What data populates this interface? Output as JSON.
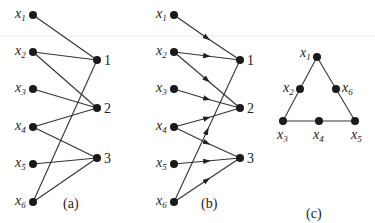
{
  "panels": [
    {
      "id": "a",
      "caption": "(a)",
      "left_nodes": [
        {
          "var": "x",
          "sub": "1"
        },
        {
          "var": "x",
          "sub": "2"
        },
        {
          "var": "x",
          "sub": "3"
        },
        {
          "var": "x",
          "sub": "4"
        },
        {
          "var": "x",
          "sub": "5"
        },
        {
          "var": "x",
          "sub": "6"
        }
      ],
      "right_nodes": [
        "1",
        "2",
        "3"
      ],
      "edges": [
        [
          "x1",
          "1"
        ],
        [
          "x2",
          "1"
        ],
        [
          "x2",
          "2"
        ],
        [
          "x3",
          "2"
        ],
        [
          "x4",
          "2"
        ],
        [
          "x4",
          "3"
        ],
        [
          "x5",
          "3"
        ],
        [
          "x6",
          "3"
        ],
        [
          "x6",
          "1"
        ]
      ],
      "directed": false
    },
    {
      "id": "b",
      "caption": "(b)",
      "left_nodes": [
        {
          "var": "x",
          "sub": "1"
        },
        {
          "var": "x",
          "sub": "2"
        },
        {
          "var": "x",
          "sub": "3"
        },
        {
          "var": "x",
          "sub": "4"
        },
        {
          "var": "x",
          "sub": "5"
        },
        {
          "var": "x",
          "sub": "6"
        }
      ],
      "right_nodes": [
        "1",
        "2",
        "3"
      ],
      "edges": [
        [
          "x1",
          "1"
        ],
        [
          "x2",
          "1"
        ],
        [
          "x2",
          "2"
        ],
        [
          "x3",
          "2"
        ],
        [
          "x4",
          "2"
        ],
        [
          "x4",
          "3"
        ],
        [
          "x5",
          "3"
        ],
        [
          "x6",
          "3"
        ],
        [
          "x6",
          "1"
        ]
      ],
      "directed": true
    },
    {
      "id": "c",
      "caption": "(c)",
      "nodes": [
        {
          "var": "x",
          "sub": "1"
        },
        {
          "var": "x",
          "sub": "2"
        },
        {
          "var": "x",
          "sub": "6"
        },
        {
          "var": "x",
          "sub": "3"
        },
        {
          "var": "x",
          "sub": "4"
        },
        {
          "var": "x",
          "sub": "5"
        }
      ],
      "shape": "triangle"
    }
  ],
  "colors": {
    "ink": "#1a1a1a",
    "background": "#ffffff"
  }
}
